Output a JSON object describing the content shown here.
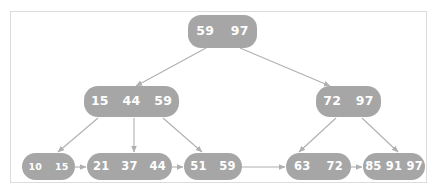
{
  "diagram": {
    "colors": {
      "node_fill": "#a6a6a6",
      "key_text": "#ffffff",
      "edge_line": "#b0b0b0",
      "frame_border": "#dcdcdc",
      "background": "#ffffff"
    },
    "levels": [
      {
        "name": "root",
        "nodes": [
          {
            "id": "root",
            "keys": [
              "59",
              "97"
            ]
          }
        ]
      },
      {
        "name": "internal",
        "nodes": [
          {
            "id": "internal-left",
            "keys": [
              "15",
              "44",
              "59"
            ]
          },
          {
            "id": "internal-right",
            "keys": [
              "72",
              "97"
            ]
          }
        ]
      },
      {
        "name": "leaves",
        "nodes": [
          {
            "id": "leaf-1",
            "keys": [
              "10",
              "15"
            ]
          },
          {
            "id": "leaf-2",
            "keys": [
              "21",
              "37",
              "44"
            ]
          },
          {
            "id": "leaf-3",
            "keys": [
              "51",
              "59"
            ]
          },
          {
            "id": "leaf-4",
            "keys": [
              "63",
              "72"
            ]
          },
          {
            "id": "leaf-5",
            "keys": [
              "85",
              "91",
              "97"
            ]
          }
        ]
      }
    ]
  }
}
